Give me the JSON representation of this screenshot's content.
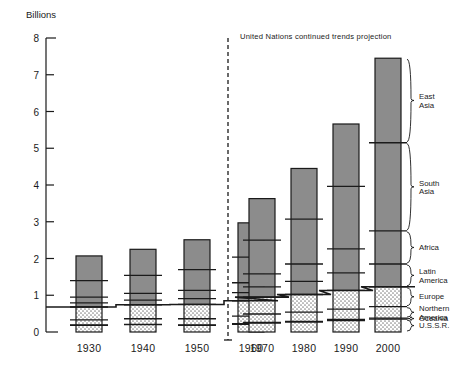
{
  "chart_data": {
    "type": "bar",
    "subtype": "stacked-bar",
    "title": "",
    "xlabel": "",
    "ylabel": "Billions",
    "ylim": [
      0,
      8
    ],
    "yticks": [
      0,
      1,
      2,
      3,
      4,
      5,
      6,
      7,
      8
    ],
    "ytick_labels": [
      "0",
      "1",
      "2",
      "3",
      "4",
      "5",
      "6",
      "7",
      "8"
    ],
    "grid": false,
    "legend_position": "right-brackets",
    "categories": [
      "1930",
      "1940",
      "1950",
      "1960",
      "1970",
      "1980",
      "1990",
      "2000"
    ],
    "series": [
      {
        "name": "U.S.S.R.",
        "fill": "stipple",
        "values": [
          0.18,
          0.2,
          0.18,
          0.21,
          0.24,
          0.27,
          0.31,
          0.35
        ]
      },
      {
        "name": "Oceania",
        "fill": "stipple",
        "values": [
          0.01,
          0.01,
          0.01,
          0.02,
          0.02,
          0.02,
          0.03,
          0.03
        ]
      },
      {
        "name": "Northern America",
        "fill": "stipple",
        "values": [
          0.14,
          0.15,
          0.17,
          0.2,
          0.23,
          0.25,
          0.28,
          0.31
        ]
      },
      {
        "name": "Europe",
        "fill": "stipple",
        "values": [
          0.35,
          0.38,
          0.39,
          0.42,
          0.46,
          0.48,
          0.51,
          0.54
        ]
      },
      {
        "name": "Latin America",
        "fill": "solid",
        "values": [
          0.11,
          0.13,
          0.16,
          0.22,
          0.28,
          0.36,
          0.48,
          0.62
        ]
      },
      {
        "name": "Africa",
        "fill": "solid",
        "values": [
          0.16,
          0.18,
          0.22,
          0.27,
          0.35,
          0.47,
          0.65,
          0.9
        ]
      },
      {
        "name": "South Asia",
        "fill": "solid",
        "values": [
          0.45,
          0.49,
          0.57,
          0.7,
          0.92,
          1.22,
          1.7,
          2.4
        ]
      },
      {
        "name": "East Asia",
        "fill": "solid",
        "values": [
          0.67,
          0.71,
          0.81,
          0.93,
          1.13,
          1.38,
          1.7,
          2.3
        ]
      }
    ],
    "totals": [
      2.07,
      2.25,
      2.51,
      2.97,
      3.63,
      4.45,
      5.66,
      7.45
    ],
    "annotations": [
      {
        "name": "projection-note",
        "text": "United Nations continued trends projection"
      },
      {
        "name": "projection-divider",
        "text": "",
        "between": [
          "1960",
          "1970"
        ]
      }
    ],
    "step_line": {
      "name": "europe-top-step-line",
      "follows": "Europe",
      "description": "stepped line tracing top of Europe segment"
    }
  },
  "axis": {
    "unit_label": "Billions",
    "ticks": [
      "8",
      "7",
      "6",
      "5",
      "4",
      "3",
      "2",
      "1",
      "0"
    ],
    "years": [
      "1930",
      "1940",
      "1950",
      "1960",
      "1970",
      "1980",
      "1990",
      "2000"
    ]
  },
  "note": {
    "projection": "United Nations continued trends projection"
  },
  "region_labels": [
    {
      "name": "east-asia",
      "text": "East Asia",
      "line1": "East",
      "line2": "Asia"
    },
    {
      "name": "south-asia",
      "text": "South Asia",
      "line1": "South",
      "line2": "Asia"
    },
    {
      "name": "africa",
      "text": "Africa",
      "line1": "Africa",
      "line2": ""
    },
    {
      "name": "latin-america",
      "text": "Latin America",
      "line1": "Latin",
      "line2": "America"
    },
    {
      "name": "europe",
      "text": "Europe",
      "line1": "Europe",
      "line2": ""
    },
    {
      "name": "northern-america",
      "text": "Northern America",
      "line1": "Northern",
      "line2": "America"
    },
    {
      "name": "oceania",
      "text": "Oceania",
      "line1": "Oceania",
      "line2": ""
    },
    {
      "name": "ussr",
      "text": "U.S.S.R.",
      "line1": "U.S.S.R.",
      "line2": ""
    }
  ],
  "colors": {
    "solid_fill": "#8c8c8c",
    "stipple_fill": "#e8e8e8",
    "stroke": "#1a1a1a",
    "background": "#ffffff"
  }
}
